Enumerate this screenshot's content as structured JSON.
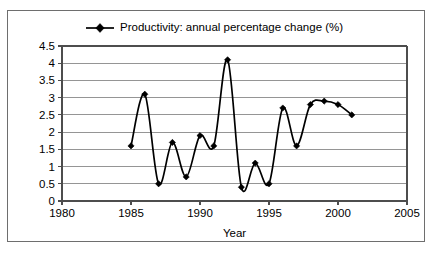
{
  "chart_data": {
    "type": "line",
    "title": "",
    "xlabel": "Year",
    "ylabel": "",
    "xlim": [
      1980,
      2005
    ],
    "ylim": [
      0,
      4.5
    ],
    "grid": "horizontal",
    "legend_position": "top-center",
    "x_ticks": [
      "1980",
      "1985",
      "1990",
      "1995",
      "2000",
      "2005"
    ],
    "x_tick_values": [
      1980,
      1985,
      1990,
      1995,
      2000,
      2005
    ],
    "y_ticks": [
      "0",
      "0.5",
      "1",
      "1.5",
      "2",
      "2.5",
      "3",
      "3.5",
      "4",
      "4.5"
    ],
    "y_tick_values": [
      0,
      0.5,
      1,
      1.5,
      2,
      2.5,
      3,
      3.5,
      4,
      4.5
    ],
    "series": [
      {
        "name": "Productivity: annual percentage change (%)",
        "marker": "diamond",
        "color": "#000000",
        "x": [
          1985,
          1986,
          1987,
          1988,
          1989,
          1990,
          1991,
          1992,
          1993,
          1994,
          1995,
          1996,
          1997,
          1998,
          1999,
          2000,
          2001
        ],
        "values": [
          1.6,
          3.1,
          0.5,
          1.7,
          0.7,
          1.9,
          1.6,
          4.1,
          0.4,
          1.1,
          0.5,
          2.7,
          1.6,
          2.8,
          2.9,
          2.8,
          2.5
        ]
      }
    ]
  },
  "legend": {
    "entries": [
      {
        "label": "Productivity: annual percentage change (%)"
      }
    ]
  },
  "axes": {
    "x_title": "Year"
  }
}
